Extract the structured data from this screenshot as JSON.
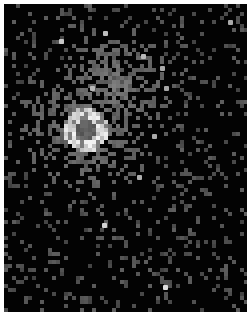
{
  "image": {
    "description": "Pixelated grayscale X-ray style image of a diffuse extended source with bright ring and darker core",
    "background_color": "#030303",
    "frame": {
      "x": 4,
      "y": 4,
      "width": 243,
      "height": 308
    },
    "cell_size": 4,
    "seed": 1337,
    "source": {
      "center_x": 86,
      "center_y": 130,
      "core_radius": 10,
      "ring_radius": 22,
      "halo_radius": 70,
      "core_level": 95,
      "ring_level": 215,
      "halo_level": 95
    },
    "halo_offset": {
      "dx": 30,
      "dy": -45
    },
    "background_density": 0.16,
    "background_level": 80,
    "point_sources": [
      {
        "x": 61,
        "y": 41,
        "level": 200
      },
      {
        "x": 105,
        "y": 33,
        "level": 190
      },
      {
        "x": 143,
        "y": 56,
        "level": 185
      },
      {
        "x": 162,
        "y": 68,
        "level": 170
      },
      {
        "x": 230,
        "y": 22,
        "level": 170
      },
      {
        "x": 92,
        "y": 88,
        "level": 185
      },
      {
        "x": 166,
        "y": 88,
        "level": 165
      },
      {
        "x": 139,
        "y": 177,
        "level": 175
      },
      {
        "x": 154,
        "y": 136,
        "level": 170
      },
      {
        "x": 104,
        "y": 225,
        "level": 210
      },
      {
        "x": 165,
        "y": 287,
        "level": 220
      }
    ]
  }
}
